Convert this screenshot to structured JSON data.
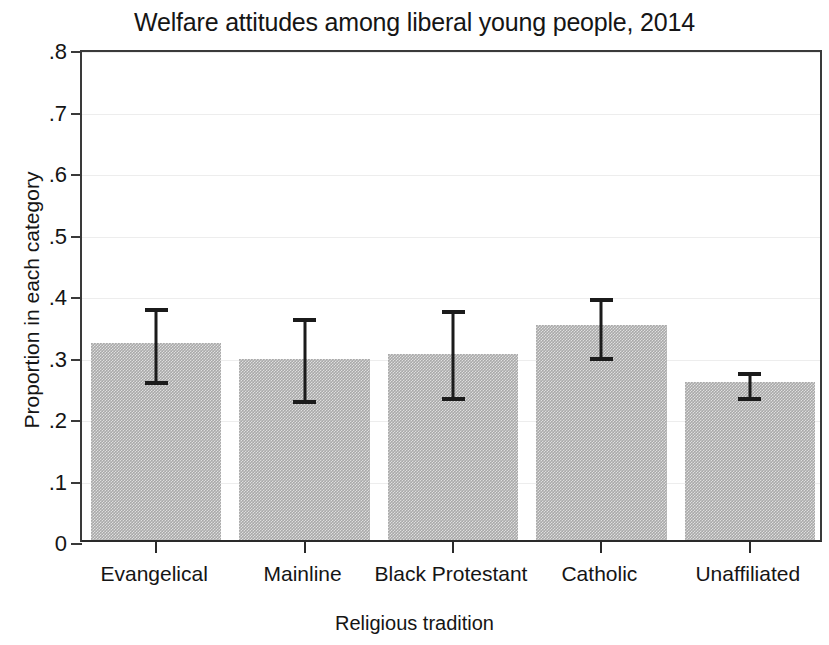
{
  "chart_data": {
    "type": "bar",
    "title": "Welfare attitudes among liberal young people, 2014",
    "xlabel": "Religious tradition",
    "ylabel": "Proportion in each category",
    "categories": [
      "Evangelical",
      "Mainline",
      "Black Protestant",
      "Catholic",
      "Unaffiliated"
    ],
    "values": [
      0.32,
      0.295,
      0.303,
      0.35,
      0.257
    ],
    "error_low": [
      0.258,
      0.227,
      0.232,
      0.298,
      0.232
    ],
    "error_high": [
      0.383,
      0.367,
      0.38,
      0.4,
      0.28
    ],
    "ylim": [
      0,
      0.8
    ],
    "ytick_values": [
      0,
      0.1,
      0.2,
      0.3,
      0.4,
      0.5,
      0.6,
      0.7,
      0.8
    ],
    "ytick_labels": [
      "0",
      ".1",
      ".2",
      ".3",
      ".4",
      ".5",
      ".6",
      ".7",
      ".8"
    ],
    "grid": true,
    "legend": "none",
    "bar_color": "#a9a9a9",
    "error_color": "#1b1b1b",
    "axis_color": "#2a2a2a",
    "grid_color": "#ededed",
    "background": "#ffffff"
  }
}
